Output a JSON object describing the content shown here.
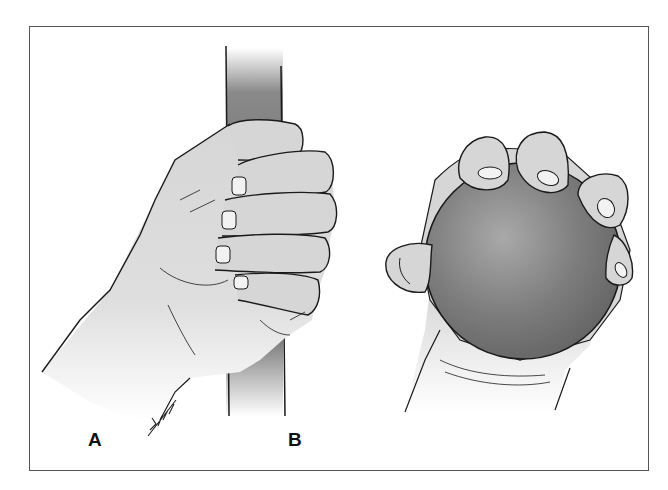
{
  "figure": {
    "panels": [
      {
        "label": "A",
        "description": "hand gripping a vertical cylindrical bar (power grip)"
      },
      {
        "label": "B",
        "description": "hand gripping a ball with fingertips (spherical grip)"
      }
    ],
    "signature": "artist-signature",
    "colors": {
      "outline": "#1a1a1a",
      "skin": "#d6d6d6",
      "bar_dark": "#6a6a6a",
      "ball": "#7a7a7a",
      "frame": "#555555"
    }
  }
}
